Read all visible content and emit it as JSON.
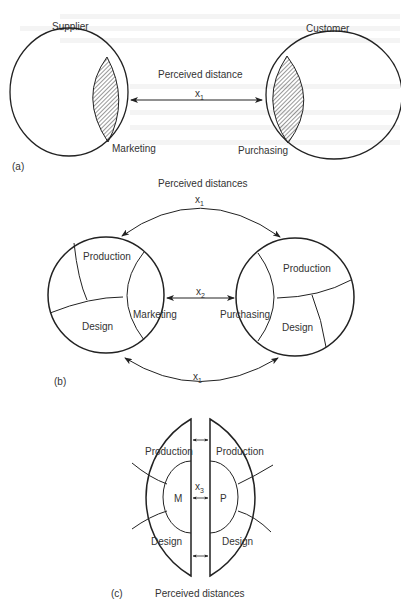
{
  "panel_a": {
    "label": "(a)",
    "supplier": "Supplier",
    "customer": "Customer",
    "marketing": "Marketing",
    "purchasing": "Purchasing",
    "distance_title": "Perceived distance",
    "distance_var": "x",
    "distance_sub": "1"
  },
  "panel_b": {
    "label": "(b)",
    "distance_title": "Perceived distances",
    "top_var": "x",
    "top_sub": "1",
    "mid_var": "x",
    "mid_sub": "2",
    "bottom_var": "x",
    "bottom_sub": "1",
    "left": {
      "production": "Production",
      "design": "Design",
      "marketing": "Marketing"
    },
    "right": {
      "production": "Production",
      "design": "Design",
      "purchasing": "Purchasing"
    }
  },
  "panel_c": {
    "label": "(c)",
    "distance_title": "Perceived distances",
    "mid_var": "x",
    "mid_sub": "3",
    "left": {
      "production": "Production",
      "design": "Design",
      "core": "M"
    },
    "right": {
      "production": "Production",
      "design": "Design",
      "core": "P"
    }
  },
  "colors": {
    "line": "#222222",
    "text": "#333333",
    "background": "#ffffff"
  }
}
